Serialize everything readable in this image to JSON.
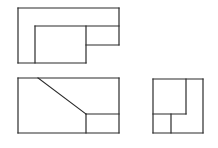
{
  "diagram": {
    "type": "orthographic-projection",
    "stroke_color": "#2a2a2a",
    "background": "#ffffff",
    "views": [
      {
        "name": "top-view",
        "lines": [
          [
            18,
            8,
            119,
            8
          ],
          [
            119,
            8,
            119,
            45
          ],
          [
            18,
            8,
            18,
            63
          ],
          [
            18,
            63,
            86,
            63
          ],
          [
            35,
            26,
            119,
            26
          ],
          [
            35,
            26,
            35,
            63
          ],
          [
            86,
            26,
            86,
            63
          ],
          [
            86,
            45,
            119,
            45
          ]
        ]
      },
      {
        "name": "front-view",
        "lines": [
          [
            18,
            78,
            119,
            78
          ],
          [
            119,
            78,
            119,
            133
          ],
          [
            18,
            133,
            119,
            133
          ],
          [
            18,
            78,
            18,
            133
          ],
          [
            38,
            78,
            86,
            114
          ],
          [
            86,
            114,
            119,
            114
          ],
          [
            86,
            114,
            86,
            133
          ]
        ]
      },
      {
        "name": "side-view",
        "lines": [
          [
            153,
            79,
            203,
            79
          ],
          [
            203,
            79,
            203,
            133
          ],
          [
            153,
            133,
            203,
            133
          ],
          [
            153,
            79,
            153,
            133
          ],
          [
            186,
            79,
            186,
            114
          ],
          [
            153,
            114,
            186,
            114
          ],
          [
            171,
            114,
            171,
            133
          ]
        ]
      }
    ]
  }
}
